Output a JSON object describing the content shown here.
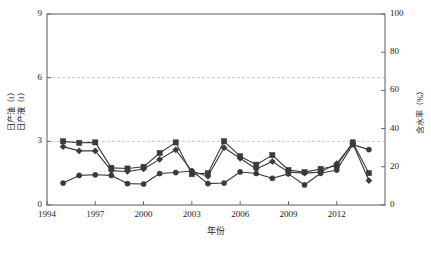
{
  "chart_data": {
    "type": "line",
    "title": "",
    "xlabel": "年份",
    "ylabel_left": "日产油（t）\n日产液（t）",
    "ylabel_left_line1": "日产油（t）",
    "ylabel_left_line2": "日产液（t）",
    "ylabel_right": "含水率（%）",
    "x": [
      1995,
      1996,
      1997,
      1998,
      1999,
      2000,
      2001,
      2002,
      2003,
      2004,
      2005,
      2006,
      2007,
      2008,
      2009,
      2010,
      2011,
      2012,
      2013,
      2014
    ],
    "xlim": [
      1994,
      2015
    ],
    "xticks": [
      1994,
      1997,
      2000,
      2003,
      2006,
      2009,
      2012
    ],
    "xticklabels": [
      "1994",
      "1997",
      "2000",
      "2003",
      "2006",
      "2009",
      "2012"
    ],
    "ylim_left": [
      0,
      9
    ],
    "yticks_left": [
      0,
      3,
      6,
      9
    ],
    "yticklabels_left": [
      "0",
      "3",
      "6",
      "9"
    ],
    "ylim_right": [
      0,
      100
    ],
    "yticks_right": [
      0,
      20,
      40,
      60,
      80,
      100
    ],
    "yticklabels_right": [
      "0",
      "20",
      "40",
      "60",
      "80",
      "100"
    ],
    "gridlines_left": [
      3,
      6
    ],
    "grid": "horizontal-dashed",
    "legend": "none",
    "series": [
      {
        "name": "日产液（t）",
        "marker": "square",
        "axis": "left",
        "color": "#3a3a3a",
        "values": [
          3.0,
          2.93,
          2.95,
          1.75,
          1.72,
          1.8,
          2.45,
          2.95,
          1.45,
          1.5,
          3.0,
          2.3,
          1.9,
          2.35,
          1.65,
          1.55,
          1.7,
          1.85,
          2.95,
          1.5
        ]
      },
      {
        "name": "日产油（t）",
        "marker": "diamond",
        "axis": "left",
        "color": "#3a3a3a",
        "values": [
          2.75,
          2.55,
          2.55,
          1.62,
          1.58,
          1.7,
          2.15,
          2.6,
          1.6,
          1.35,
          2.7,
          2.2,
          1.7,
          2.05,
          1.55,
          1.5,
          1.55,
          1.95,
          2.9,
          1.15
        ]
      },
      {
        "name": "含水率（%）",
        "marker": "circle",
        "axis": "right",
        "color": "#3a3a3a",
        "values": [
          11.5,
          15.5,
          15.8,
          15.5,
          11.2,
          11.0,
          16.5,
          17.0,
          17.8,
          11.2,
          11.5,
          17.3,
          16.5,
          14.0,
          16.3,
          10.5,
          16.6,
          18.3,
          31.6,
          29.0
        ]
      }
    ]
  },
  "axes": {
    "plot_left_px": 47,
    "plot_right_px": 385,
    "plot_top_px": 14,
    "plot_bottom_px": 205
  }
}
